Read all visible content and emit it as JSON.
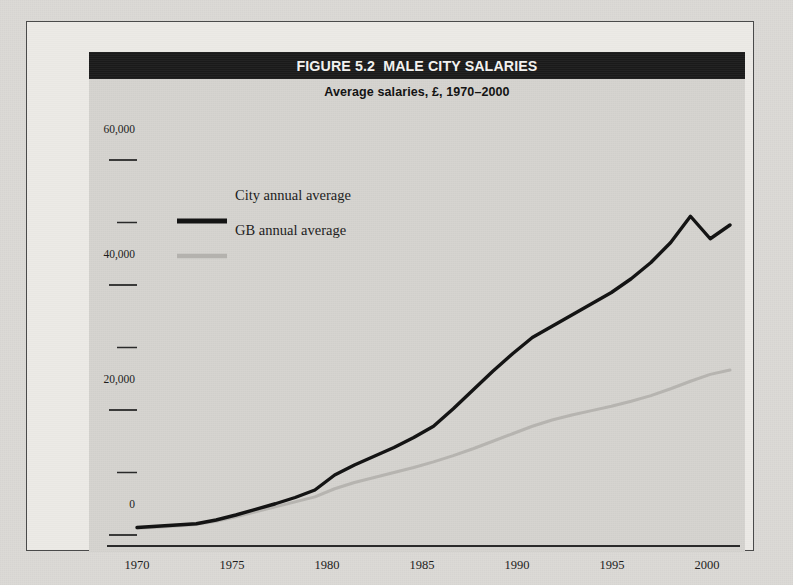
{
  "figure": {
    "title": "FIGURE 5.2  MALE CITY SALARIES",
    "subtitle": "Average salaries, £, 1970–2000"
  },
  "legend": {
    "entries": [
      {
        "label": "City annual average",
        "color": "#141414",
        "marker": "thick-black-line"
      },
      {
        "label": "GB annual average",
        "color": "#b4b2ae",
        "marker": "thick-grey-line"
      }
    ]
  },
  "axes": {
    "y_tick_labels": [
      "60,000",
      "40,000",
      "20,000",
      "0"
    ],
    "y_ticks_all": [
      0,
      10000,
      20000,
      30000,
      40000,
      50000,
      60000
    ],
    "x_tick_labels": [
      "1970",
      "1975",
      "1980",
      "1985",
      "1990",
      "1995",
      "2000"
    ]
  },
  "chart_data": {
    "type": "line",
    "title": "FIGURE 5.2  MALE CITY SALARIES",
    "subtitle": "Average salaries, £, 1970–2000",
    "xlabel": "",
    "ylabel": "",
    "xlim": [
      1970,
      2000
    ],
    "ylim": [
      0,
      60000
    ],
    "grid": false,
    "legend_position": "upper-left-inside",
    "x": [
      1970,
      1971,
      1972,
      1973,
      1974,
      1975,
      1976,
      1977,
      1978,
      1979,
      1980,
      1981,
      1982,
      1983,
      1984,
      1985,
      1986,
      1987,
      1988,
      1989,
      1990,
      1991,
      1992,
      1993,
      1994,
      1995,
      1996,
      1997,
      1998,
      1999,
      2000
    ],
    "series": [
      {
        "name": "City annual average",
        "color": "#141414",
        "values": [
          1200,
          1400,
          1600,
          1800,
          2400,
          3200,
          4100,
          5000,
          6000,
          7200,
          9600,
          11200,
          12600,
          14000,
          15600,
          17400,
          20200,
          23200,
          26200,
          29000,
          31600,
          33400,
          35200,
          37000,
          38800,
          41000,
          43600,
          46800,
          51000,
          47400,
          49600
        ]
      },
      {
        "name": "GB annual average",
        "color": "#b4b2ae",
        "values": [
          1100,
          1250,
          1450,
          1700,
          2200,
          2900,
          3700,
          4500,
          5300,
          6100,
          7400,
          8400,
          9200,
          10000,
          10800,
          11700,
          12700,
          13800,
          15000,
          16200,
          17400,
          18400,
          19200,
          19900,
          20600,
          21400,
          22300,
          23400,
          24600,
          25700,
          26400
        ]
      }
    ]
  }
}
